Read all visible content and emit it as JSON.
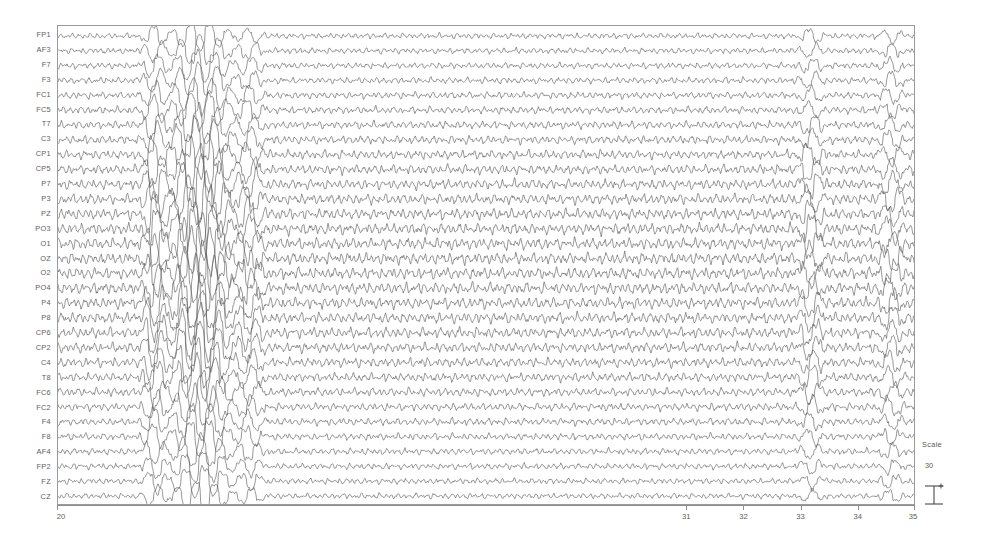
{
  "plot": {
    "type": "eeg-multichannel-timeseries",
    "background_color": "#ffffff",
    "trace_color": "#555555",
    "frame_color": "#9a9a9a"
  },
  "channels": [
    {
      "label": "FP1"
    },
    {
      "label": "AF3"
    },
    {
      "label": "F7"
    },
    {
      "label": "F3"
    },
    {
      "label": "FC1"
    },
    {
      "label": "FC5"
    },
    {
      "label": "T7"
    },
    {
      "label": "C3"
    },
    {
      "label": "CP1"
    },
    {
      "label": "CP5"
    },
    {
      "label": "P7"
    },
    {
      "label": "P3"
    },
    {
      "label": "PZ"
    },
    {
      "label": "PO3"
    },
    {
      "label": "O1"
    },
    {
      "label": "OZ"
    },
    {
      "label": "O2"
    },
    {
      "label": "PO4"
    },
    {
      "label": "P4"
    },
    {
      "label": "P8"
    },
    {
      "label": "CP6"
    },
    {
      "label": "CP2"
    },
    {
      "label": "C4"
    },
    {
      "label": "T8"
    },
    {
      "label": "FC6"
    },
    {
      "label": "FC2"
    },
    {
      "label": "F4"
    },
    {
      "label": "F8"
    },
    {
      "label": "AF4"
    },
    {
      "label": "FP2"
    },
    {
      "label": "FZ"
    },
    {
      "label": "CZ"
    }
  ],
  "x_axis": {
    "label": "",
    "min": 20,
    "max": 35,
    "ticks": [
      20,
      31,
      32,
      33,
      34,
      35
    ],
    "tick_labels": [
      "20",
      "31",
      "32",
      "33",
      "34",
      "35"
    ]
  },
  "scale_legend": {
    "title": "Scale",
    "value": "30",
    "bar_icon": "i-beam-scale-bar"
  },
  "chart_data": {
    "type": "line",
    "title": "",
    "xlabel": "",
    "ylabel": "",
    "xlim": [
      20,
      35
    ],
    "grid": false,
    "legend_position": "right",
    "n_series": 32,
    "categories": [
      "FP1",
      "AF3",
      "F7",
      "F3",
      "FC1",
      "FC5",
      "T7",
      "C3",
      "CP1",
      "CP5",
      "P7",
      "P3",
      "PZ",
      "PO3",
      "O1",
      "OZ",
      "O2",
      "PO4",
      "P4",
      "P8",
      "CP6",
      "CP2",
      "C4",
      "T8",
      "FC6",
      "FC2",
      "F4",
      "F8",
      "AF4",
      "FP2",
      "FZ",
      "CZ"
    ],
    "burst_events": [
      {
        "start": 21.55,
        "end": 21.85,
        "relative_amplitude": 2.4
      },
      {
        "start": 21.95,
        "end": 23.05,
        "relative_amplitude": 3.2
      },
      {
        "start": 23.15,
        "end": 23.55,
        "relative_amplitude": 1.7
      },
      {
        "start": 33.05,
        "end": 33.35,
        "relative_amplitude": 1.5
      },
      {
        "start": 34.45,
        "end": 34.75,
        "relative_amplitude": 1.4
      }
    ],
    "background_rhythm": {
      "dominant_frequency_hz": 9.5,
      "relative_amplitude": 1.0,
      "description": "continuous low-amplitude mixed-frequency background activity"
    },
    "series": [
      {
        "name": "FP1",
        "baseline_index": 0
      },
      {
        "name": "AF3",
        "baseline_index": 1
      },
      {
        "name": "F7",
        "baseline_index": 2
      },
      {
        "name": "F3",
        "baseline_index": 3
      },
      {
        "name": "FC1",
        "baseline_index": 4
      },
      {
        "name": "FC5",
        "baseline_index": 5
      },
      {
        "name": "T7",
        "baseline_index": 6
      },
      {
        "name": "C3",
        "baseline_index": 7
      },
      {
        "name": "CP1",
        "baseline_index": 8
      },
      {
        "name": "CP5",
        "baseline_index": 9
      },
      {
        "name": "P7",
        "baseline_index": 10
      },
      {
        "name": "P3",
        "baseline_index": 11
      },
      {
        "name": "PZ",
        "baseline_index": 12
      },
      {
        "name": "PO3",
        "baseline_index": 13
      },
      {
        "name": "O1",
        "baseline_index": 14
      },
      {
        "name": "OZ",
        "baseline_index": 15
      },
      {
        "name": "O2",
        "baseline_index": 16
      },
      {
        "name": "PO4",
        "baseline_index": 17
      },
      {
        "name": "P4",
        "baseline_index": 18
      },
      {
        "name": "P8",
        "baseline_index": 19
      },
      {
        "name": "CP6",
        "baseline_index": 20
      },
      {
        "name": "CP2",
        "baseline_index": 21
      },
      {
        "name": "C4",
        "baseline_index": 22
      },
      {
        "name": "T8",
        "baseline_index": 23
      },
      {
        "name": "FC6",
        "baseline_index": 24
      },
      {
        "name": "FC2",
        "baseline_index": 25
      },
      {
        "name": "F4",
        "baseline_index": 26
      },
      {
        "name": "F8",
        "baseline_index": 27
      },
      {
        "name": "AF4",
        "baseline_index": 28
      },
      {
        "name": "FP2",
        "baseline_index": 29
      },
      {
        "name": "FZ",
        "baseline_index": 30
      },
      {
        "name": "CZ",
        "baseline_index": 31
      }
    ]
  }
}
